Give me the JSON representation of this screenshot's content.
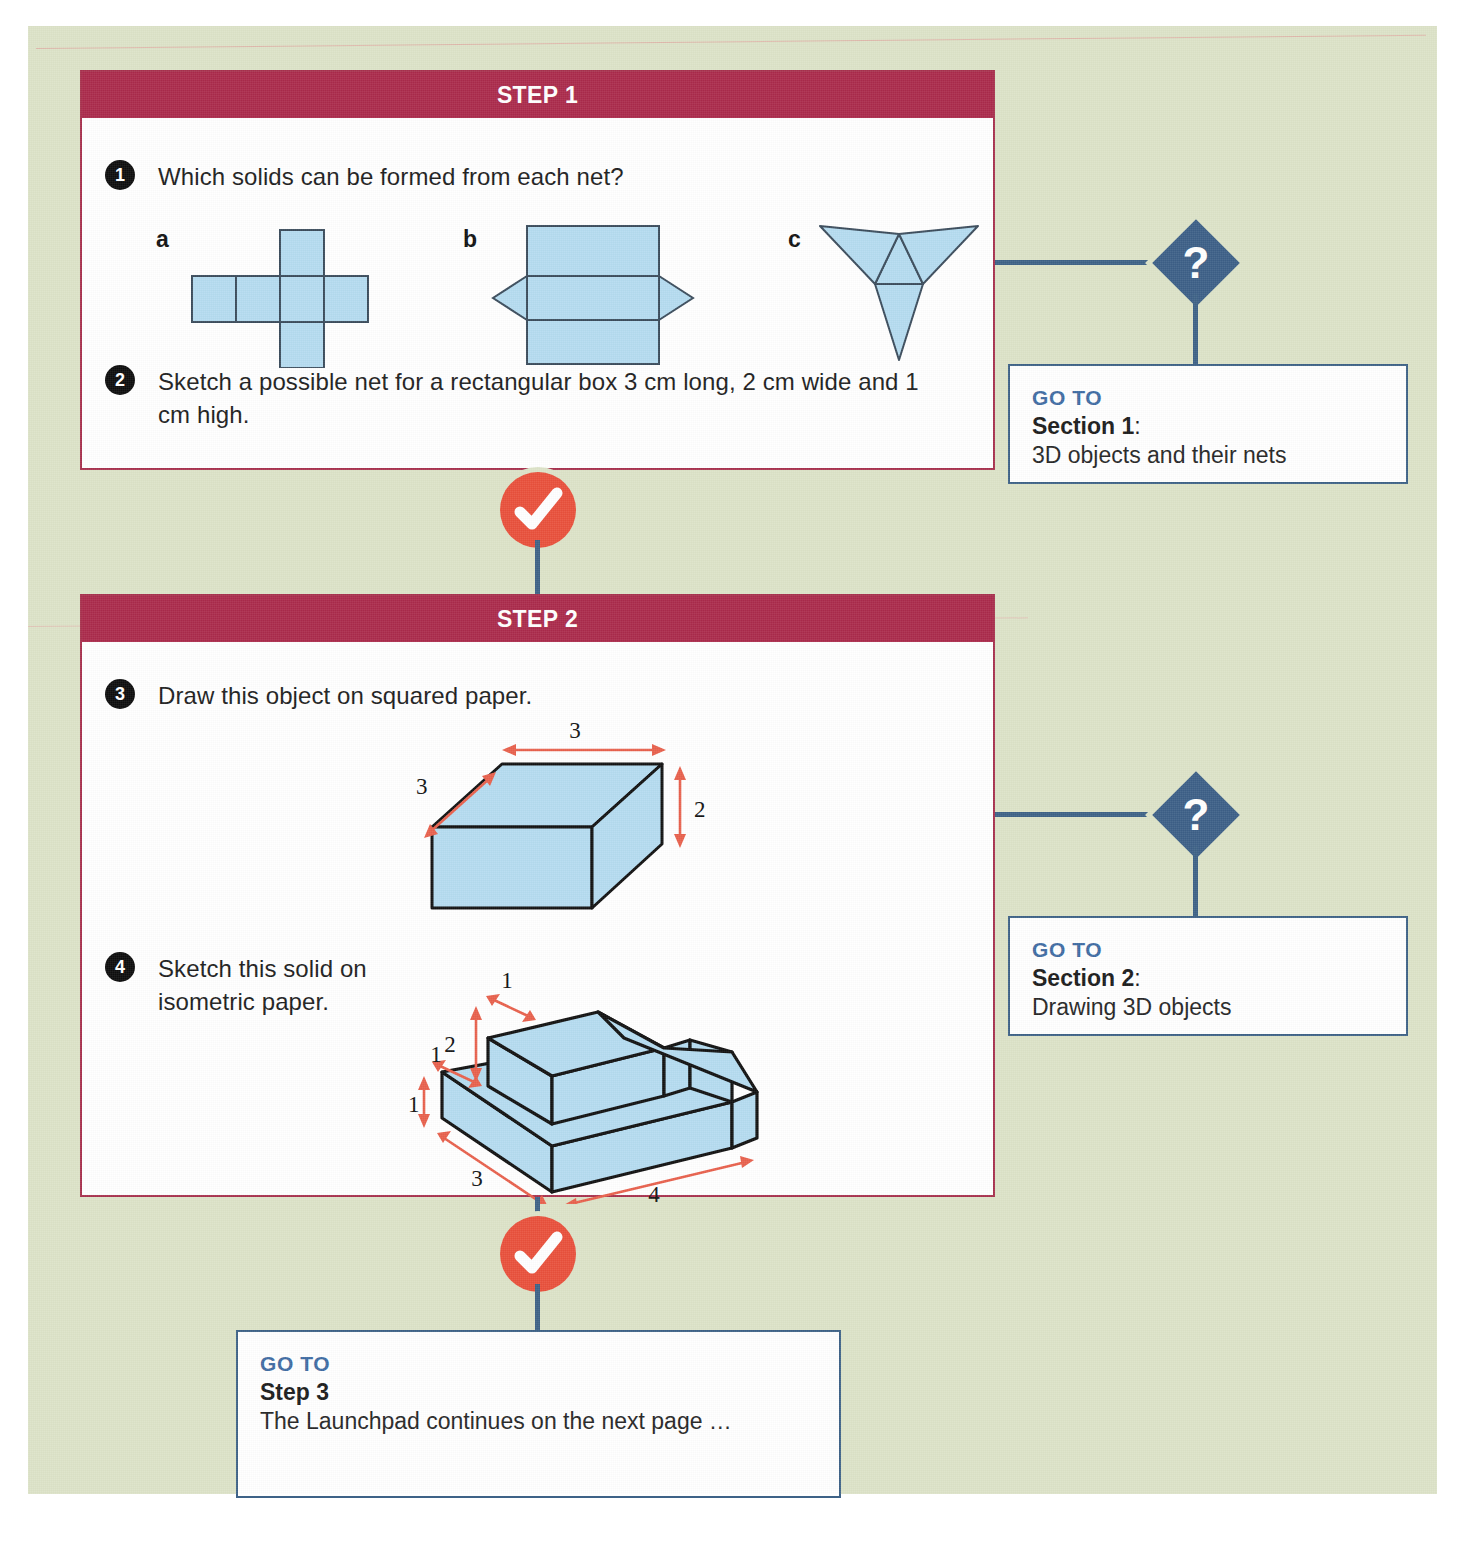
{
  "page": {
    "background_color": "#dde3c8",
    "accent_red": "#ab2a4b",
    "accent_blue": "#3e6287",
    "accent_coral": "#e9503b",
    "figure_fill": "#b5dcf0"
  },
  "steps": [
    {
      "header": "STEP 1",
      "questions": [
        {
          "number": "1",
          "text": "Which solids can be formed from each net?",
          "nets": [
            {
              "letter": "a",
              "name": "cube-net"
            },
            {
              "letter": "b",
              "name": "triangular-prism-net"
            },
            {
              "letter": "c",
              "name": "tetrahedron-net"
            }
          ]
        },
        {
          "number": "2",
          "text": "Sketch a possible net for a rectangular box 3 cm long, 2 cm wide and 1 cm high."
        }
      ]
    },
    {
      "header": "STEP 2",
      "questions": [
        {
          "number": "3",
          "text": "Draw this object on squared paper.",
          "figure": {
            "name": "cuboid",
            "dimensions": [
              {
                "label": "3",
                "edge": "top-width"
              },
              {
                "label": "3",
                "edge": "depth"
              },
              {
                "label": "2",
                "edge": "height"
              }
            ]
          }
        },
        {
          "number": "4",
          "text": "Sketch this solid on isometric paper.",
          "figure": {
            "name": "stepped-solid",
            "dimensions": [
              {
                "label": "1",
                "edge": "top-step-width"
              },
              {
                "label": "2",
                "edge": "upper-height"
              },
              {
                "label": "1",
                "edge": "lower-step-width"
              },
              {
                "label": "1",
                "edge": "lower-height"
              },
              {
                "label": "3",
                "edge": "depth"
              },
              {
                "label": "4",
                "edge": "length"
              }
            ]
          }
        }
      ]
    }
  ],
  "goto_boxes": [
    {
      "label": "GO TO",
      "section": "Section 1",
      "section_suffix": ":",
      "description": "3D objects and their nets"
    },
    {
      "label": "GO TO",
      "section": "Section 2",
      "section_suffix": ":",
      "description": "Drawing 3D objects"
    },
    {
      "label": "GO TO",
      "section": "Step 3",
      "section_suffix": "",
      "description": "The Launchpad continues on the next page …"
    }
  ],
  "markers": {
    "question_glyph": "?",
    "check_glyph": "check"
  }
}
